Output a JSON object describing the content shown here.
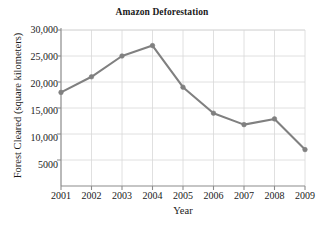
{
  "chart_data": {
    "type": "line",
    "title": "Amazon Deforestation",
    "xlabel": "Year",
    "ylabel": "Forest Cleared (square kilometers)",
    "categories": [
      "2001",
      "2002",
      "2003",
      "2004",
      "2005",
      "2006",
      "2007",
      "2008",
      "2009"
    ],
    "x": [
      2001,
      2002,
      2003,
      2004,
      2005,
      2006,
      2007,
      2008,
      2009
    ],
    "values": [
      18000,
      21000,
      25000,
      27000,
      19000,
      14000,
      11800,
      12900,
      7000
    ],
    "series": [
      {
        "name": "Forest Cleared",
        "values": [
          18000,
          21000,
          25000,
          27000,
          19000,
          14000,
          11800,
          12900,
          7000
        ]
      }
    ],
    "ylim": [
      0,
      30000
    ],
    "xlim": [
      2001,
      2009
    ],
    "y_ticks": [
      5000,
      10000,
      15000,
      20000,
      25000,
      30000
    ],
    "y_tick_labels": [
      "5000",
      "10,000",
      "15,000",
      "20,000",
      "25,000",
      "30,000"
    ],
    "grid": true,
    "legend": "none",
    "line_color": "#808080",
    "marker_color": "#808080",
    "grid_color": "#d8d8d8",
    "axis_color": "#8c8c8c",
    "marker": "circle"
  }
}
